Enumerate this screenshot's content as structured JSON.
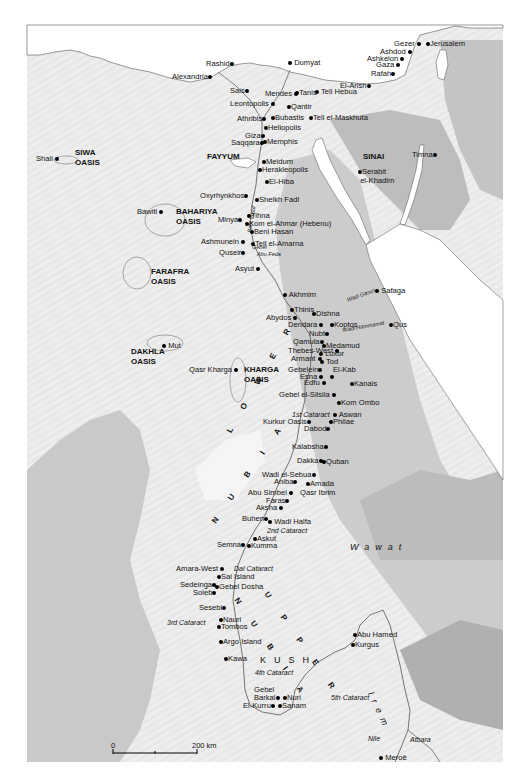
{
  "map": {
    "title": "",
    "scale": {
      "start_label": "0",
      "end_label": "200 km"
    },
    "colors": {
      "background": "#ffffff",
      "land_light": "#eeeeee",
      "land_mid": "#d9d9d9",
      "highland": "#bfbfbf",
      "highland_dark": "#a8a8a8",
      "water": "#ffffff",
      "coast_line": "#555555",
      "river": "#666666"
    },
    "regions": [
      {
        "label_line1": "SIWA",
        "label_line2": "OASIS"
      },
      {
        "label_line1": "FAYYUM",
        "label_line2": ""
      },
      {
        "label_line1": "BAHARIYA",
        "label_line2": "OASIS"
      },
      {
        "label_line1": "FARAFRA",
        "label_line2": "OASIS"
      },
      {
        "label_line1": "DAKHLA",
        "label_line2": "OASIS"
      },
      {
        "label_line1": "KHARGA",
        "label_line2": "OASIS"
      },
      {
        "label_line1": "SINAI",
        "label_line2": ""
      }
    ],
    "large_regions": {
      "lower_nubia_lower": "L O W E R",
      "lower_nubia_nubia": "N U B I A",
      "upper_nubia_upper": "U P P E R",
      "upper_nubia_nubia": "N U B I A",
      "wawat": "Wawat",
      "kush": "KUSH",
      "irem": "Irem"
    },
    "features": {
      "bahr_yusuf": "Bahr Yusuf",
      "gebel_abu_feda_1": "Gebel",
      "gebel_abu_feda_2": "Abu Feda",
      "wadi_gasus": "Wadi Gasus",
      "wadi_hammamat": "Wadi Hammamat",
      "cataract_1": "1st Cataract",
      "cataract_2": "2nd Cataract",
      "cataract_dal": "Dal Cataract",
      "cataract_3": "3rd Cataract",
      "cataract_4": "4th Cataract",
      "cataract_5": "5th Cataract",
      "nile": "Nile",
      "atbara": "Atbara"
    },
    "places": {
      "rashid": "Rashid",
      "dumyat": "Dumyat",
      "alexandria": "Alexandria",
      "gezer": "Gezer",
      "jerusalem": "Jerusalem",
      "ashdod": "Ashdod",
      "ashkelon": "Ashkelon",
      "gaza": "Gaza",
      "rafah": "Rafah",
      "el_arish": "El-Arish",
      "sais": "Sais",
      "mendes": "Mendes",
      "tanis": "Tanis",
      "tell_hebua": "Tell Hebua",
      "leontopolis": "Leontopolis",
      "qantir": "Qantir",
      "athribis": "Athribis",
      "bubastis": "Bubastis",
      "tell_el_maskhuta": "Tell el-Maskhuta",
      "heliopolis": "Heliopolis",
      "giza": "Giza",
      "saqqara": "Saqqara",
      "memphis": "Memphis",
      "shali": "Shali",
      "timna": "Timna",
      "serabit_1": "Serabit",
      "serabit_2": "el-Khadim",
      "meidum": "Meidum",
      "herakleopolis": "Herakleopolis",
      "el_hiba": "El-Hiba",
      "oxyrhynkhos": "Oxyrhynkhos",
      "sheikh_fadl": "Sheikh Fadl",
      "bawiti": "Bawiti",
      "tihna": "Tihna",
      "minya": "Minya",
      "kom_el_ahmar": "Kom el-Ahmar (Hebenu)",
      "beni_hasan": "Beni Hasan",
      "ashmunein": "Ashmunein",
      "tell_el_amarna": "Tell el-Amarna",
      "quseir": "Quseir",
      "asyut": "Asyut",
      "akhmim": "Akhmim",
      "safaga": "Safaga",
      "thinis": "Thinis",
      "abydos": "Abydos",
      "dishna": "Dishna",
      "dendara": "Dendara",
      "koptos": "Koptos",
      "qus": "Qus",
      "nubt": "Nubt",
      "qamula": "Qamula",
      "medamud": "Medamud",
      "thebes_west": "Thebes-West",
      "luxor": "Luxor",
      "armant": "Armant",
      "tod": "Tod",
      "gebelein": "Gebelein",
      "el_kab": "El-Kab",
      "esna": "Esna",
      "edfu": "Edfu",
      "kanais": "Kanais",
      "mut": "Mut",
      "qasr_kharga": "Qasr Kharga",
      "gebel_el_silsila": "Gebel el-Silsila",
      "kom_ombo": "Kom Ombo",
      "aswan": "Aswan",
      "kurkur_oasis": "Kurkur Oasis",
      "philae": "Philae",
      "dabod": "Dabod",
      "kalabsha": "Kalabsha",
      "dakka": "Dakka",
      "quban": "Quban",
      "wadi_el_sebua": "Wadi el-Sebua",
      "aniba": "Aniba",
      "amada": "Amada",
      "abu_simbel": "Abu Simbel",
      "qasr_ibrim": "Qasr Ibrim",
      "faras": "Faras",
      "aksha": "Aksha",
      "buhen": "Buhen",
      "wadi_halfa": "Wadi Halfa",
      "askut": "Askut",
      "semna": "Semna",
      "kumma": "Kumma",
      "amara_west": "Amara-West",
      "sai_island": "Sai Island",
      "sedeinga": "Sedeinga",
      "gebel_dosha": "Gebel Dosha",
      "soleb": "Soleb",
      "sesebi": "Sesebi",
      "nauri": "Nauri",
      "tombos": "Tombos",
      "argo_island": "Argo Island",
      "kawa": "Kawa",
      "abu_hamed": "Abu Hamed",
      "kurgus": "Kurgus",
      "gebel_barkal_1": "Gebel",
      "gebel_barkal_2": "Barkal",
      "nuri": "Nuri",
      "el_kurru": "El-Kurru",
      "sanam": "Sanam",
      "meroe": "Meroë"
    }
  }
}
